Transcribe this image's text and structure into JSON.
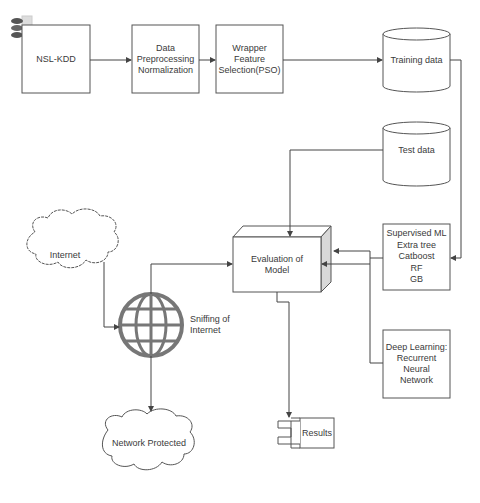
{
  "diagram": {
    "nodes": {
      "nsl_kdd": {
        "label": "NSL-KDD",
        "shape": "rectangle"
      },
      "preprocessing": {
        "lines": [
          "Data",
          "Preprocessing",
          "Normalization"
        ],
        "shape": "rectangle"
      },
      "feature_selection": {
        "lines": [
          "Wrapper",
          "Feature",
          "Selection(PSO)"
        ],
        "shape": "rectangle"
      },
      "training_data": {
        "label": "Training data",
        "shape": "cylinder"
      },
      "test_data": {
        "label": "Test data",
        "shape": "cylinder"
      },
      "supervised_ml": {
        "lines": [
          "Supervised ML",
          "Extra tree",
          "Catboost",
          "RF",
          "GB"
        ],
        "shape": "rectangle"
      },
      "deep_learning": {
        "lines": [
          "Deep Learning:",
          "Recurrent",
          "Neural",
          "Network"
        ],
        "shape": "rectangle"
      },
      "evaluation": {
        "lines": [
          "Evaluation of",
          "Model"
        ],
        "shape": "3d-box"
      },
      "internet": {
        "label": "Internet",
        "shape": "cloud"
      },
      "sniffing": {
        "lines": [
          "Sniffing of",
          "Internet"
        ],
        "shape": "globe-icon"
      },
      "network_protected": {
        "label": "Network Protected",
        "shape": "cloud"
      },
      "results": {
        "label": "Results",
        "shape": "component"
      }
    },
    "edges": [
      {
        "from": "NSL-KDD",
        "to": "Data Preprocessing Normalization"
      },
      {
        "from": "Data Preprocessing Normalization",
        "to": "Wrapper Feature Selection(PSO)"
      },
      {
        "from": "Wrapper Feature Selection(PSO)",
        "to": "Training data"
      },
      {
        "from": "Training data",
        "to": "Supervised ML"
      },
      {
        "from": "Test data",
        "to": "Evaluation of Model"
      },
      {
        "from": "Supervised ML",
        "to": "Evaluation of Model"
      },
      {
        "from": "Deep Learning: Recurrent Neural Network",
        "to": "Evaluation of Model"
      },
      {
        "from": "Internet",
        "to": "Sniffing of Internet"
      },
      {
        "from": "Sniffing of Internet",
        "to": "Evaluation of Model"
      },
      {
        "from": "Sniffing of Internet",
        "to": "Network Protected"
      },
      {
        "from": "Evaluation of Model",
        "to": "Results"
      }
    ],
    "colors": {
      "stroke": "#555555",
      "fill": "#ffffff",
      "globe": "#777777",
      "box_side": "#d8d8d8",
      "text": "#3a3a3a"
    }
  }
}
